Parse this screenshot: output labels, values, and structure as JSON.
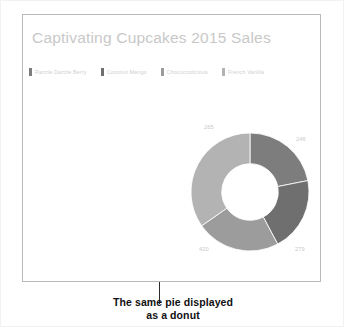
{
  "figure": {
    "caption_lines": [
      "The same pie displayed",
      "as a donut"
    ],
    "leader_line_color": "#2b2b2b",
    "frame_border_color": "#b9b9b9"
  },
  "chart_data": {
    "type": "pie",
    "variant": "donut",
    "title": "Captivating Cupcakes 2015 Sales",
    "title_color": "#c8c8c8",
    "categories": [
      "Razzle Dazzle Berry",
      "Coconut Mango",
      "Chococcolicious",
      "French Vanilla"
    ],
    "values": [
      265,
      246,
      279,
      420
    ],
    "labels": [
      "265",
      "246",
      "279",
      "420"
    ],
    "colors": [
      "#7d7d7d",
      "#6f6f6f",
      "#9c9c9c",
      "#b3b3b3"
    ],
    "label_color": "#c9c9c9",
    "legend_position": "top",
    "legend": [
      {
        "label": "Razzle Dazzle Berry",
        "color": "#7d7d7d"
      },
      {
        "label": "Coconut Mango",
        "color": "#6f6f6f"
      },
      {
        "label": "Chococcolicious",
        "color": "#9c9c9c"
      },
      {
        "label": "French Vanilla",
        "color": "#b3b3b3"
      }
    ],
    "hole_ratio": 0.48,
    "start_angle_deg": -90,
    "grid": false,
    "xlabel": "",
    "ylabel": ""
  }
}
